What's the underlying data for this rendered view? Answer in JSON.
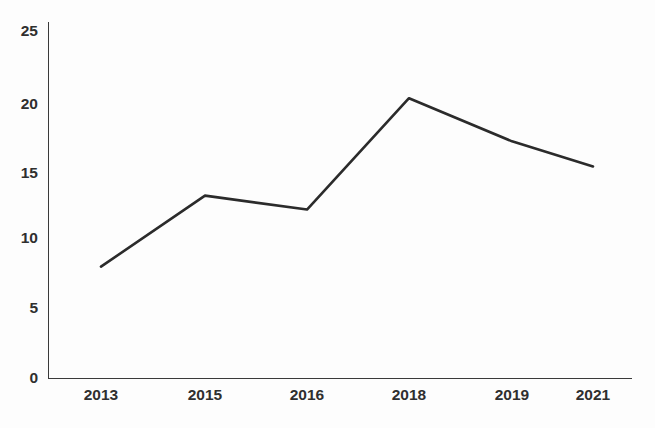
{
  "chart_data": {
    "type": "line",
    "title": "",
    "subtitle": "",
    "xlabel": "",
    "ylabel": "",
    "categories": [
      "2013",
      "2015",
      "2016",
      "2018",
      "2019",
      "2021"
    ],
    "x": [
      2013,
      2015,
      2016,
      2018,
      2019,
      2021
    ],
    "values": [
      8,
      13.1,
      12.1,
      20.1,
      17,
      15.2
    ],
    "series": [
      {
        "name": "",
        "values": [
          8,
          13.1,
          12.1,
          20.1,
          17,
          15.2
        ],
        "color": "#2b2b2b"
      }
    ],
    "ylim": [
      0,
      25
    ],
    "yticks": [
      0,
      5,
      10,
      15,
      20,
      25
    ],
    "ytick_labels": [
      "0",
      "5",
      "10",
      "15",
      "20",
      "25"
    ],
    "xtick_labels": [
      "2013",
      "2015",
      "2016",
      "2018",
      "2019",
      "2021"
    ],
    "grid": false,
    "legend": false,
    "legend_position": "none",
    "annotations": []
  },
  "style": {
    "background_color": "#fdfdfd",
    "axis_color": "#3a3a3a",
    "line_color": "#2b2b2b",
    "label_color": "#2f2f2f",
    "line_width": 2.6
  },
  "geometry": {
    "plot_left": 48,
    "plot_right": 632,
    "plot_top": 22,
    "plot_bottom": 378,
    "y_axis_top_value": 25,
    "point_x_positions": [
      101,
      205,
      307,
      409,
      512,
      593
    ],
    "y_tick_y_positions": [
      378,
      308,
      238,
      168,
      98,
      30
    ],
    "x_label_y": 400
  }
}
